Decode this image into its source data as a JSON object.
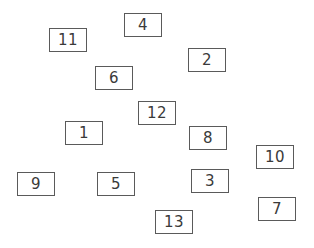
{
  "boxes": [
    {
      "label": "4",
      "x": 124,
      "y": 13
    },
    {
      "label": "11",
      "x": 49,
      "y": 28
    },
    {
      "label": "2",
      "x": 188,
      "y": 48
    },
    {
      "label": "6",
      "x": 95,
      "y": 66
    },
    {
      "label": "12",
      "x": 138,
      "y": 101
    },
    {
      "label": "1",
      "x": 65,
      "y": 121
    },
    {
      "label": "8",
      "x": 189,
      "y": 126
    },
    {
      "label": "10",
      "x": 256,
      "y": 145
    },
    {
      "label": "3",
      "x": 191,
      "y": 169
    },
    {
      "label": "9",
      "x": 17,
      "y": 172
    },
    {
      "label": "5",
      "x": 97,
      "y": 172
    },
    {
      "label": "7",
      "x": 258,
      "y": 197
    },
    {
      "label": "13",
      "x": 155,
      "y": 210
    }
  ]
}
